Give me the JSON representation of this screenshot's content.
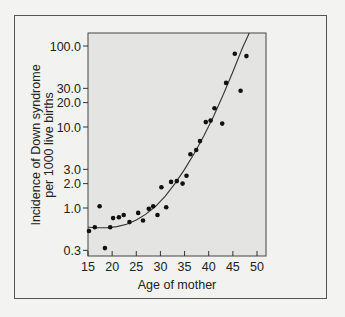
{
  "chart_data": {
    "type": "scatter",
    "title": "",
    "xlabel": "Age of mother",
    "ylabel_lines": [
      "Incidence of Down syndrome",
      "per 1000 live births"
    ],
    "ylabel": "Incidence of Down syndrome per 1000 live births",
    "xscale": "linear",
    "yscale": "log",
    "xlim": [
      15,
      52
    ],
    "ylim": [
      0.27,
      160
    ],
    "x_ticks": [
      15,
      20,
      25,
      30,
      35,
      40,
      45,
      50
    ],
    "x_tick_labels": [
      "15",
      "20",
      "25",
      "30",
      "35",
      "40",
      "45",
      "50"
    ],
    "y_ticks": [
      0.3,
      1.0,
      2.0,
      3.0,
      10.0,
      20.0,
      30.0,
      100.0
    ],
    "y_tick_labels": [
      "0.3",
      "1.0",
      "2.0",
      "3.0",
      "10.0",
      "20.0",
      "30.0",
      "100.0"
    ],
    "grid": false,
    "legend": null,
    "series": [
      {
        "name": "Observed incidence",
        "kind": "scatter",
        "x": [
          15.2,
          16.4,
          17.4,
          18.5,
          19.6,
          20.2,
          21.4,
          22.4,
          23.6,
          25.4,
          26.4,
          27.6,
          28.5,
          29.4,
          30.2,
          31.2,
          32.2,
          33.4,
          34.6,
          35.4,
          36.2,
          37.4,
          38.2,
          39.4,
          40.4,
          41.2,
          42.8,
          43.6,
          45.4,
          46.6,
          47.8
        ],
        "y": [
          0.52,
          0.58,
          1.05,
          0.32,
          0.58,
          0.75,
          0.77,
          0.82,
          0.67,
          0.87,
          0.7,
          0.98,
          1.05,
          0.82,
          1.8,
          1.02,
          2.1,
          2.15,
          2.0,
          2.5,
          4.6,
          5.2,
          6.7,
          11.5,
          12.0,
          17.0,
          11.0,
          35.0,
          80.0,
          28.0,
          75.0
        ]
      },
      {
        "name": "Fitted curve",
        "kind": "line",
        "x": [
          15,
          17,
          19,
          21,
          23,
          25,
          27,
          29,
          31,
          33,
          35,
          37,
          39,
          41,
          43,
          45,
          47,
          48.4
        ],
        "y": [
          0.58,
          0.57,
          0.57,
          0.59,
          0.63,
          0.71,
          0.84,
          1.05,
          1.4,
          2.0,
          3.0,
          4.7,
          7.8,
          13.5,
          25,
          48,
          95,
          150
        ]
      }
    ],
    "colors": {
      "plot_background": "#e4e4e2",
      "page_background": "#f3f3f1",
      "marker": "#111111",
      "line": "#333333",
      "frame": "#555555"
    }
  }
}
